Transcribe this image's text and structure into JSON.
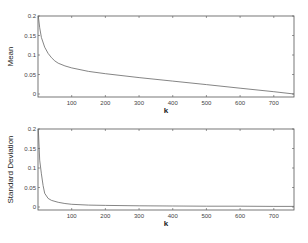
{
  "chart_data": [
    {
      "type": "line",
      "title": "",
      "xlabel": "k",
      "ylabel": "Mean",
      "xlim": [
        0,
        760
      ],
      "ylim": [
        -0.005,
        0.2
      ],
      "xticks": [
        "100",
        "200",
        "300",
        "400",
        "500",
        "600",
        "700"
      ],
      "yticks": [
        "0",
        "0.05",
        "0.1",
        "0.15",
        "0.2"
      ],
      "grid": false,
      "series": [
        {
          "name": "Mean",
          "x": [
            1,
            5,
            10,
            20,
            30,
            40,
            50,
            60,
            80,
            100,
            150,
            200,
            300,
            400,
            500,
            600,
            700,
            760
          ],
          "y": [
            0.2,
            0.17,
            0.145,
            0.12,
            0.104,
            0.093,
            0.085,
            0.079,
            0.072,
            0.067,
            0.058,
            0.052,
            0.042,
            0.033,
            0.024,
            0.015,
            0.006,
            0.0
          ]
        }
      ]
    },
    {
      "type": "line",
      "title": "",
      "xlabel": "k",
      "ylabel": "Standard Deviation",
      "xlim": [
        0,
        760
      ],
      "ylim": [
        -0.005,
        0.2
      ],
      "xticks": [
        "100",
        "200",
        "300",
        "400",
        "500",
        "600",
        "700"
      ],
      "yticks": [
        "0",
        "0.05",
        "0.1",
        "0.15",
        "0.2"
      ],
      "grid": false,
      "series": [
        {
          "name": "Standard Deviation",
          "x": [
            1,
            5,
            10,
            15,
            20,
            30,
            40,
            60,
            80,
            100,
            150,
            200,
            300,
            400,
            500,
            600,
            700,
            760
          ],
          "y": [
            0.2,
            0.12,
            0.085,
            0.055,
            0.035,
            0.022,
            0.017,
            0.012,
            0.009,
            0.007,
            0.005,
            0.004,
            0.003,
            0.0025,
            0.002,
            0.002,
            0.0015,
            0.0015
          ]
        }
      ]
    }
  ]
}
